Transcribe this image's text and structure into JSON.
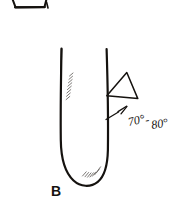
{
  "figure": {
    "kind": "hand-drawn-diagram",
    "background_color": "#ffffff",
    "ink_color": "#15120f",
    "hatch_color": "#6d6a66",
    "width": 187,
    "height": 210
  },
  "labels": {
    "vessel_label": "B",
    "angle_annotation": "70° - 80°",
    "angle_value_min": "70°",
    "angle_separator": "-",
    "angle_value_max": "80°"
  },
  "parts": {
    "top_partial_shape": "truncated-triangle-cropped",
    "vessel": "u-shaped-tube",
    "wedge": "triangle-wedge",
    "angle_marks": "angle-tick-lines",
    "hatching_upper": "diagonal-hatching-upper-left",
    "hatching_lower": "diagonal-hatching-lower-right"
  }
}
